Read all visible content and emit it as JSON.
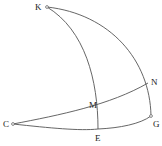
{
  "diagram": {
    "type": "spherical-geometry",
    "stroke_color": "#555555",
    "label_color": "#222222",
    "points": {
      "K": {
        "label": "K",
        "x": 47,
        "y": 7
      },
      "C": {
        "label": "C",
        "x": 13,
        "y": 124
      },
      "E": {
        "label": "E",
        "x": 98,
        "y": 129
      },
      "G": {
        "label": "G",
        "x": 151,
        "y": 116
      },
      "N": {
        "label": "N",
        "x": 148,
        "y": 83
      },
      "M": {
        "label": "M",
        "x": 99,
        "y": 109
      }
    },
    "arcs": [
      {
        "name": "arc-KG",
        "from": "K",
        "to": "G"
      },
      {
        "name": "arc-KE",
        "from": "K",
        "to": "E"
      },
      {
        "name": "arc-CN",
        "from": "C",
        "to": "N",
        "through": "M"
      },
      {
        "name": "arc-CG",
        "from": "C",
        "to": "G",
        "through": "E"
      }
    ]
  }
}
